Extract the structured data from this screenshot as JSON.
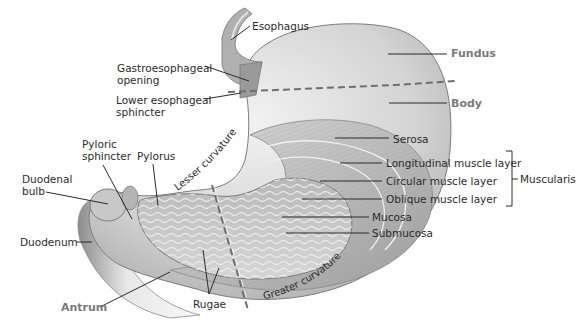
{
  "diagram": {
    "colors": {
      "tissue_light": "#e6e6e6",
      "tissue_mid": "#bdbdbd",
      "tissue_dark": "#8f8f8f",
      "outline": "#7d7d7d",
      "leader_line": "#2b2b2b",
      "region_label": "#7a7a7a",
      "dashed_divider": "#6f6f6f"
    },
    "labels": {
      "esophagus": "Esophagus",
      "gastroesophageal_opening_1": "Gastroesophageal",
      "gastroesophageal_opening_2": "opening",
      "lower_esophageal_sphincter_1": "Lower esophageal",
      "lower_esophageal_sphincter_2": "sphincter",
      "pyloric_sphincter_1": "Pyloric",
      "pyloric_sphincter_2": "sphincter",
      "pylorus": "Pylorus",
      "duodenal_bulb_1": "Duodenal",
      "duodenal_bulb_2": "bulb",
      "duodenum": "Duodenum",
      "rugae": "Rugae",
      "serosa": "Serosa",
      "longitudinal_muscle_layer": "Longitudinal muscle layer",
      "circular_muscle_layer": "Circular muscle layer",
      "oblique_muscle_layer": "Oblique muscle layer",
      "mucosa": "Mucosa",
      "submucosa": "Submucosa",
      "muscularis": "Muscularis",
      "lesser_curvature": "Lesser curvature",
      "greater_curvature": "Greater curvature"
    },
    "regions": {
      "fundus": "Fundus",
      "body": "Body",
      "antrum": "Antrum"
    }
  }
}
